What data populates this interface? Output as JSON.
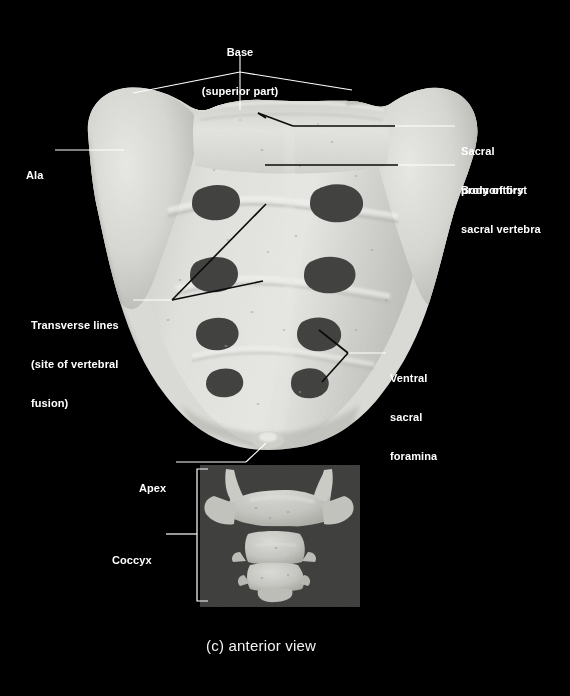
{
  "figure": {
    "caption": "(c) anterior view",
    "background_color": "#000000",
    "label_color": "#ffffff",
    "bone_color": "#d8d8d4",
    "specimen": "sacrum-and-coccyx"
  },
  "labels": [
    {
      "name": "base-superior-part",
      "lines": [
        "Base",
        "(superior part)"
      ],
      "line1": "Base",
      "line2": "(superior part)",
      "x": 240,
      "y": 26,
      "align": "center"
    },
    {
      "name": "ala",
      "lines": [
        "Ala"
      ],
      "line1": "Ala",
      "x": 26,
      "y": 143,
      "align": "left"
    },
    {
      "name": "sacral-promontory",
      "lines": [
        "Sacral",
        "promontory"
      ],
      "line1": "Sacral",
      "line2": "promontory",
      "x": 461,
      "y": 120,
      "align": "left"
    },
    {
      "name": "body-of-first-sacral-vertebra",
      "lines": [
        "Body of first",
        "sacral vertebra"
      ],
      "line1": "Body of first",
      "line2": "sacral vertebra",
      "x": 461,
      "y": 159,
      "align": "left"
    },
    {
      "name": "transverse-lines",
      "lines": [
        "Transverse lines",
        "(site of vertebral",
        "fusion)"
      ],
      "line1": "Transverse lines",
      "line2": "(site of vertebral",
      "line3": "fusion)",
      "x": 31,
      "y": 292,
      "align": "left"
    },
    {
      "name": "ventral-sacral-foramina",
      "lines": [
        "Ventral",
        "sacral",
        "foramina"
      ],
      "line1": "Ventral",
      "line2": "sacral",
      "line3": "foramina",
      "x": 389,
      "y": 347,
      "align": "left"
    },
    {
      "name": "apex",
      "lines": [
        "Apex"
      ],
      "line1": "Apex",
      "x": 139,
      "y": 456,
      "align": "left"
    },
    {
      "name": "coccyx",
      "lines": [
        "Coccyx"
      ],
      "line1": "Coccyx",
      "x": 112,
      "y": 528,
      "align": "left"
    }
  ],
  "anatomy": {
    "foramina_pairs": 4,
    "transverse_line_count": 3,
    "coccyx_segments": 4,
    "bracket": {
      "x": 197,
      "top": 469,
      "bottom": 601,
      "tick": 11
    }
  }
}
